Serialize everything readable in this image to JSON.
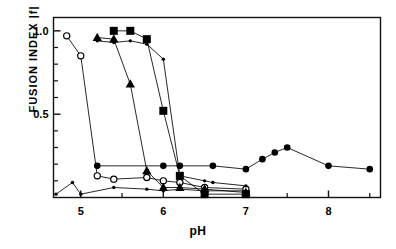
{
  "chart_data": {
    "type": "line",
    "title": "",
    "xlabel": "pH",
    "ylabel": "FUSION INDEX  |f|",
    "xlim": [
      4.67,
      8.63
    ],
    "ylim": [
      0.0,
      1.08
    ],
    "grid": false,
    "legend": "none",
    "xticks": [
      5,
      6,
      7,
      8
    ],
    "xtick_labels": [
      "5",
      "6",
      "7",
      "8"
    ],
    "xminor_ticks": [
      5.5,
      6.5,
      7.5,
      8.5
    ],
    "yticks": [
      0.5,
      1.0
    ],
    "ytick_labels": [
      "0.5",
      "1.0"
    ],
    "yminor_ticks": [
      0.1,
      0.2,
      0.3,
      0.4,
      0.6,
      0.7,
      0.8,
      0.9
    ],
    "series": [
      {
        "name": "open-circle-series",
        "marker": "open-circle",
        "x": [
          4.83,
          5.0,
          5.2,
          5.4,
          5.8,
          6.0,
          6.2,
          6.5,
          7.0
        ],
        "values": [
          0.97,
          0.85,
          0.13,
          0.11,
          0.12,
          0.1,
          0.09,
          0.06,
          0.05
        ]
      },
      {
        "name": "triangle-series",
        "marker": "filled-triangle",
        "x": [
          5.2,
          5.4,
          5.6,
          5.8,
          6.0,
          6.2,
          6.5,
          7.0
        ],
        "values": [
          0.96,
          0.95,
          0.68,
          0.16,
          0.06,
          0.06,
          0.05,
          0.03
        ]
      },
      {
        "name": "square-series",
        "marker": "filled-square",
        "x": [
          5.4,
          5.6,
          5.8,
          6.0,
          6.2,
          6.5,
          7.0
        ],
        "values": [
          1.0,
          1.0,
          0.95,
          0.52,
          0.13,
          0.02,
          0.02
        ]
      },
      {
        "name": "small-dot-upper-series",
        "marker": "small-dot",
        "x": [
          5.2,
          5.4,
          5.6,
          5.8,
          6.0,
          6.2,
          6.5,
          6.6,
          7.0
        ],
        "values": [
          0.94,
          0.93,
          0.94,
          0.92,
          0.83,
          0.13,
          0.1,
          0.09,
          0.07
        ]
      },
      {
        "name": "large-circle-series",
        "marker": "filled-circle",
        "x": [
          5.2,
          6.0,
          6.2,
          6.6,
          7.0,
          7.2,
          7.35,
          7.5,
          8.0,
          8.5
        ],
        "values": [
          0.19,
          0.19,
          0.19,
          0.19,
          0.17,
          0.23,
          0.27,
          0.3,
          0.19,
          0.17
        ]
      },
      {
        "name": "small-dot-baseline-series",
        "marker": "small-dot",
        "x": [
          4.7,
          4.9,
          5.0,
          5.4,
          5.8,
          6.0,
          6.2,
          6.5,
          7.0
        ],
        "values": [
          0.02,
          0.09,
          0.02,
          0.06,
          0.05,
          0.04,
          0.05,
          0.04,
          0.04
        ]
      }
    ]
  }
}
